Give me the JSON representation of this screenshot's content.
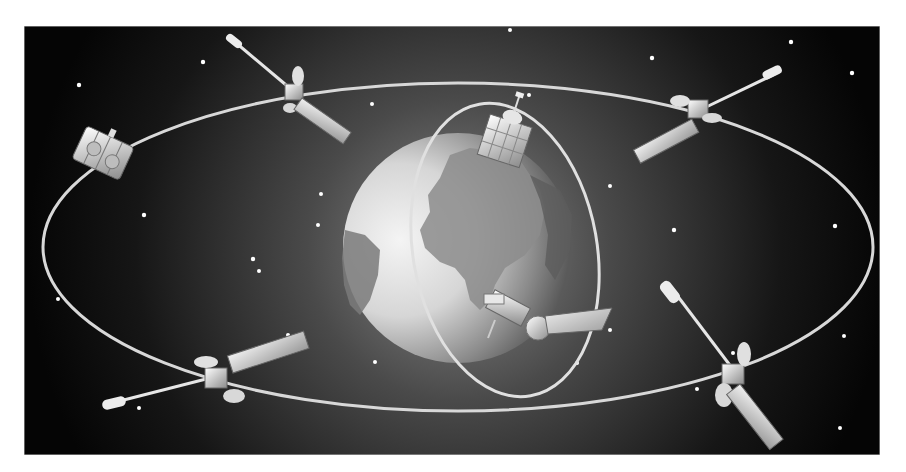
{
  "image": {
    "subject": "satellite-constellation-illustration",
    "background_color": "#0a0a0a",
    "frame": {
      "x": 24,
      "y": 26,
      "width": 856,
      "height": 429
    },
    "earth": {
      "cx": 458,
      "cy": 248,
      "r": 115
    },
    "orbits": [
      {
        "name": "equatorial-orbit",
        "cx": 458,
        "cy": 246,
        "rx": 415,
        "ry": 162
      },
      {
        "name": "polar-orbit",
        "cx": 505,
        "cy": 250,
        "rx": 88,
        "ry": 148,
        "rotate": -8
      }
    ],
    "satellites": [
      {
        "name": "satellite-top-left-drum",
        "x": 100,
        "y": 155
      },
      {
        "name": "satellite-top-left-antenna",
        "x": 295,
        "y": 95
      },
      {
        "name": "satellite-top-center-cube",
        "x": 505,
        "y": 135
      },
      {
        "name": "satellite-top-right",
        "x": 695,
        "y": 112
      },
      {
        "name": "satellite-bottom-left",
        "x": 215,
        "y": 375
      },
      {
        "name": "satellite-bottom-center",
        "x": 525,
        "y": 325
      },
      {
        "name": "satellite-bottom-right",
        "x": 735,
        "y": 370
      }
    ],
    "star_count": 26
  }
}
